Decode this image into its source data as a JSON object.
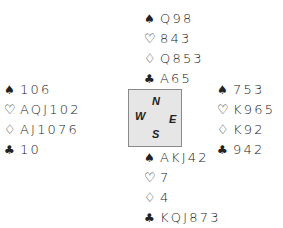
{
  "diagram": {
    "type": "bridge-deal",
    "suit_symbols": {
      "spades": "♠",
      "hearts": "♡",
      "diamonds": "♢",
      "clubs": "♣"
    },
    "hands": {
      "north": {
        "spades": "Q98",
        "hearts": "843",
        "diamonds": "Q853",
        "clubs": "A65"
      },
      "west": {
        "spades": "106",
        "hearts": "AQJ102",
        "diamonds": "AJ1076",
        "clubs": "10"
      },
      "east": {
        "spades": "753",
        "hearts": "K965",
        "diamonds": "K92",
        "clubs": "942"
      },
      "south": {
        "spades": "AKJ42",
        "hearts": "7",
        "diamonds": "4",
        "clubs": "KQJ873"
      }
    },
    "compass": {
      "north": "N",
      "west": "W",
      "east": "E",
      "south": "S",
      "background": "#e6e6e6",
      "border": "#8a8a8a"
    }
  }
}
